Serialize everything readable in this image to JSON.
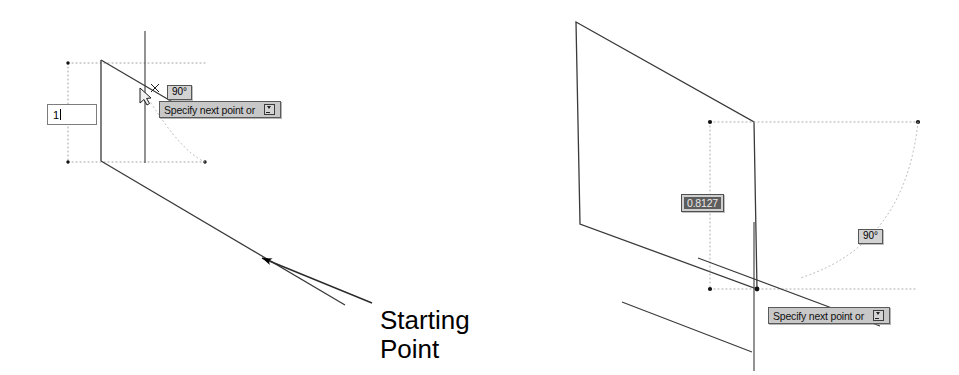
{
  "figure": {
    "background_color": "#ffffff",
    "geometry_color": "#3a3a3a",
    "tracking_color": "#9a9a9a",
    "tooltip_bg": "#c8c8c8",
    "tooltip_border": "#5a5a5a",
    "selected_field_bg": "#5d5d5d",
    "selected_field_text": "#e8e8e8"
  },
  "left_panel": {
    "name": "left-diagram",
    "length_input": {
      "value": "1",
      "placeholder": "",
      "has_caret": true
    },
    "angle_chip": {
      "value": "90°"
    },
    "prompt_tooltip": {
      "label": "Specify next point or",
      "expand_icon": "expand-options-icon"
    },
    "cursor_icon": "crosshair-cursor-icon",
    "annotation": {
      "text": "Starting\nPoint",
      "arrow_icon": "leader-arrow-icon"
    }
  },
  "right_panel": {
    "name": "right-diagram",
    "distance_field": {
      "value": "0.8127",
      "selected": true
    },
    "angle_chip": {
      "value": "90°"
    },
    "prompt_tooltip": {
      "label": "Specify next point or",
      "expand_icon": "expand-options-icon"
    }
  }
}
